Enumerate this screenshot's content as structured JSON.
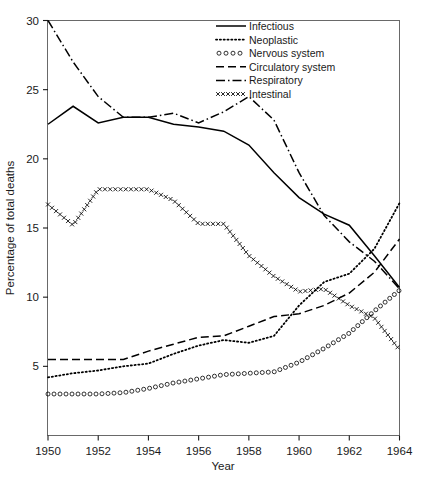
{
  "chart_data": {
    "type": "line",
    "title": "",
    "xlabel": "Year",
    "ylabel": "Percentage of total deaths",
    "xlim": [
      1950,
      1964
    ],
    "ylim": [
      0,
      30
    ],
    "xticks": [
      1950,
      1952,
      1954,
      1956,
      1958,
      1960,
      1962,
      1964
    ],
    "xtick_labels": [
      "1950",
      "1952",
      "1954",
      "1956",
      "1958",
      "1960",
      "1962",
      "1964"
    ],
    "yticks": [
      5,
      10,
      15,
      20,
      25,
      30
    ],
    "ytick_labels": [
      "5",
      "10",
      "15",
      "20",
      "25",
      "30"
    ],
    "grid": false,
    "legend_position": "top-right",
    "x": [
      1950,
      1951,
      1952,
      1953,
      1954,
      1955,
      1956,
      1957,
      1958,
      1959,
      1960,
      1961,
      1962,
      1963,
      1964
    ],
    "series": [
      {
        "name": "Infectious",
        "style": "solid",
        "values": [
          22.5,
          23.8,
          22.6,
          23.0,
          23.0,
          22.5,
          22.3,
          22.0,
          21.0,
          19.0,
          17.2,
          16.0,
          15.2,
          13.0,
          10.7
        ]
      },
      {
        "name": "Neoplastic",
        "style": "dotted",
        "values": [
          4.2,
          4.5,
          4.7,
          5.0,
          5.2,
          5.9,
          6.5,
          6.9,
          6.7,
          7.2,
          9.4,
          11.1,
          11.7,
          13.5,
          16.8
        ]
      },
      {
        "name": "Nervous system",
        "style": "circles",
        "values": [
          3.0,
          3.0,
          3.0,
          3.1,
          3.4,
          3.8,
          4.1,
          4.4,
          4.5,
          4.6,
          5.3,
          6.3,
          7.4,
          9.0,
          10.5
        ]
      },
      {
        "name": "Circulatory system",
        "style": "dashed",
        "values": [
          5.5,
          5.5,
          5.5,
          5.5,
          6.1,
          6.6,
          7.1,
          7.2,
          7.9,
          8.6,
          8.8,
          9.4,
          10.3,
          11.8,
          14.2
        ]
      },
      {
        "name": "Respiratory",
        "style": "dash-dot",
        "values": [
          30.0,
          27.0,
          24.5,
          23.0,
          23.0,
          23.3,
          22.6,
          23.4,
          24.5,
          22.8,
          19.0,
          15.9,
          14.0,
          12.6,
          10.6
        ]
      },
      {
        "name": "Intestinal",
        "style": "crosses",
        "values": [
          16.7,
          15.2,
          17.8,
          17.8,
          17.8,
          17.0,
          15.3,
          15.3,
          13.0,
          11.5,
          10.4,
          10.6,
          9.4,
          8.5,
          6.2
        ]
      }
    ]
  },
  "legend": {
    "entries": [
      {
        "label": "Infectious",
        "marker": "solid-line"
      },
      {
        "label": "Neoplastic",
        "marker": "dotted-line"
      },
      {
        "label": "Nervous system",
        "marker": "circle-line"
      },
      {
        "label": "Circulatory system",
        "marker": "dashed-line"
      },
      {
        "label": "Respiratory",
        "marker": "dash-dot-line"
      },
      {
        "label": "Intestinal",
        "marker": "cross-line"
      }
    ]
  }
}
